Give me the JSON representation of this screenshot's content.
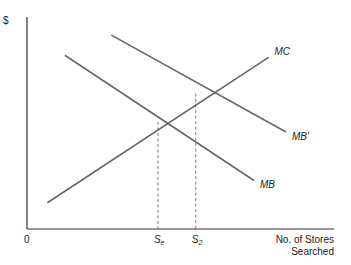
{
  "chart_data": {
    "type": "line",
    "title": "",
    "ylabel": "$",
    "xlabel": [
      "No. of Stores",
      "Searched"
    ],
    "origin_label": "0",
    "xlim": [
      0,
      10
    ],
    "ylim": [
      0,
      10
    ],
    "grid": false,
    "series": [
      {
        "name": "MC",
        "label": "MC",
        "points": [
          [
            0.7,
            1.3
          ],
          [
            8.3,
            8.5
          ]
        ]
      },
      {
        "name": "MB",
        "label": "MB",
        "points": [
          [
            1.3,
            8.6
          ],
          [
            7.8,
            2.4
          ]
        ]
      },
      {
        "name": "MB'",
        "label": "MB'",
        "points": [
          [
            2.9,
            9.6
          ],
          [
            8.9,
            4.8
          ]
        ]
      }
    ],
    "x_ticks": [
      {
        "label": "S",
        "sub": "e",
        "x": 4.5,
        "meets": "MB-MC intersection",
        "y": 5.3
      },
      {
        "label": "S",
        "sub": "2",
        "x": 5.8,
        "meets": "MB'-MC intersection",
        "y": 6.7
      }
    ]
  }
}
